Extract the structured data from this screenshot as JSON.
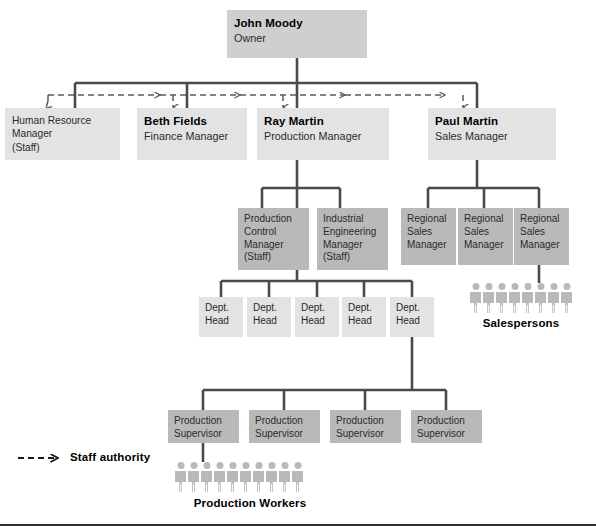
{
  "chart_title": "Organization Chart",
  "colors": {
    "box_light": "#e3e3e3",
    "box_mid": "#cfcfcf",
    "box_dark": "#b9b9b9",
    "line": "#4a4a4a",
    "dashed_line": "#5a5a5a",
    "text": "#1a1a1a"
  },
  "nodes": {
    "owner": {
      "name": "John Moody",
      "title": "Owner"
    },
    "hr": {
      "name": "",
      "title": "Human Resource Manager (Staff)",
      "line1": "Human Resource",
      "line2": "Manager",
      "line3": "(Staff)"
    },
    "finance": {
      "name": "Beth Fields",
      "title": "Finance Manager"
    },
    "production": {
      "name": "Ray Martin",
      "title": "Production Manager"
    },
    "sales": {
      "name": "Paul Martin",
      "title": "Sales Manager"
    },
    "prod_control": {
      "line1": "Production",
      "line2": "Control",
      "line3": "Manager",
      "line4": "(Staff)"
    },
    "ind_eng": {
      "line1": "Industrial",
      "line2": "Engineering",
      "line3": "Manager",
      "line4": "(Staff)"
    },
    "regional_sales": [
      {
        "line1": "Regional",
        "line2": "Sales",
        "line3": "Manager"
      },
      {
        "line1": "Regional",
        "line2": "Sales",
        "line3": "Manager"
      },
      {
        "line1": "Regional",
        "line2": "Sales",
        "line3": "Manager"
      }
    ],
    "dept_heads": [
      {
        "line1": "Dept.",
        "line2": "Head"
      },
      {
        "line1": "Dept.",
        "line2": "Head"
      },
      {
        "line1": "Dept.",
        "line2": "Head"
      },
      {
        "line1": "Dept.",
        "line2": "Head"
      },
      {
        "line1": "Dept.",
        "line2": "Head"
      }
    ],
    "production_supervisors": [
      {
        "line1": "Production",
        "line2": "Supervisor"
      },
      {
        "line1": "Production",
        "line2": "Supervisor"
      },
      {
        "line1": "Production",
        "line2": "Supervisor"
      },
      {
        "line1": "Production",
        "line2": "Supervisor"
      }
    ]
  },
  "groups": {
    "salespersons": {
      "label": "Salespersons",
      "count": 8
    },
    "production_workers": {
      "label": "Production Workers",
      "count": 10
    }
  },
  "legend": {
    "staff_authority_label": "Staff authority"
  }
}
